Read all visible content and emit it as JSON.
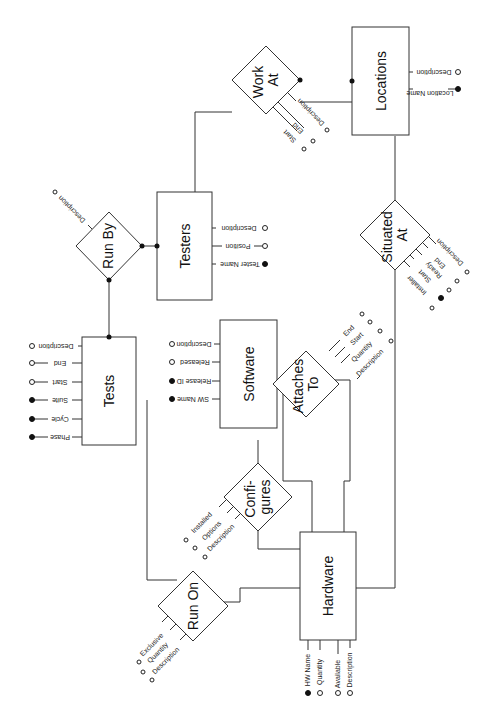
{
  "diagram": {
    "type": "entity-relationship",
    "orientation": "rotated 90 degrees clockwise",
    "entities": [
      {
        "id": "tests",
        "label": "Tests",
        "attributes": [
          {
            "name": "Phase",
            "key": true
          },
          {
            "name": "Cycle",
            "key": true
          },
          {
            "name": "Suite",
            "key": true
          },
          {
            "name": "Start",
            "key": false
          },
          {
            "name": "End",
            "key": false
          },
          {
            "name": "Description",
            "key": false
          }
        ]
      },
      {
        "id": "testers",
        "label": "Testers",
        "attributes": [
          {
            "name": "Tester Name",
            "key": true
          },
          {
            "name": "Position",
            "key": false
          },
          {
            "name": "Description",
            "key": false
          }
        ]
      },
      {
        "id": "software",
        "label": "Software",
        "attributes": [
          {
            "name": "SW Name",
            "key": true
          },
          {
            "name": "Release ID",
            "key": true
          },
          {
            "name": "Released",
            "key": false
          },
          {
            "name": "Description",
            "key": false
          }
        ]
      },
      {
        "id": "locations",
        "label": "Locations",
        "attributes": [
          {
            "name": "Location Name",
            "key": true
          },
          {
            "name": "Description",
            "key": false
          }
        ]
      },
      {
        "id": "hardware",
        "label": "Hardware",
        "attributes": [
          {
            "name": "HW Name",
            "key": true
          },
          {
            "name": "Quantity",
            "key": false
          },
          {
            "name": "Available",
            "key": false
          },
          {
            "name": "Description",
            "key": false
          }
        ]
      }
    ],
    "relationships": [
      {
        "id": "run_by",
        "label": "Run By",
        "attributes": [
          {
            "name": "Description",
            "key": false
          }
        ]
      },
      {
        "id": "work_at",
        "label_line1": "Work",
        "label_line2": "At",
        "attributes": [
          {
            "name": "Start",
            "key": false
          },
          {
            "name": "End",
            "key": false
          },
          {
            "name": "Description",
            "key": false
          }
        ]
      },
      {
        "id": "situated_at",
        "label_line1": "Situated",
        "label_line2": "At",
        "attributes": [
          {
            "name": "Installer",
            "key": false
          },
          {
            "name": "Start",
            "key": true
          },
          {
            "name": "Ready",
            "key": false
          },
          {
            "name": "End",
            "key": false
          },
          {
            "name": "Description",
            "key": false
          }
        ]
      },
      {
        "id": "attaches_to",
        "label_line1": "Attaches",
        "label_line2": "To",
        "attributes": [
          {
            "name": "End",
            "key": false
          },
          {
            "name": "Start",
            "key": false
          },
          {
            "name": "Quantity",
            "key": false
          },
          {
            "name": "Description",
            "key": false
          }
        ]
      },
      {
        "id": "configures",
        "label_line1": "Confi-",
        "label_line2": "gures",
        "attributes": [
          {
            "name": "Installed",
            "key": false
          },
          {
            "name": "Options",
            "key": false
          },
          {
            "name": "Description",
            "key": false
          }
        ]
      },
      {
        "id": "run_on",
        "label": "Run On",
        "attributes": [
          {
            "name": "Exclusive",
            "key": false
          },
          {
            "name": "Quantity",
            "key": false
          },
          {
            "name": "Description",
            "key": false
          }
        ]
      }
    ],
    "connections": [
      [
        "tests",
        "run_by"
      ],
      [
        "run_by",
        "testers"
      ],
      [
        "testers",
        "work_at"
      ],
      [
        "work_at",
        "locations"
      ],
      [
        "locations",
        "situated_at"
      ],
      [
        "situated_at",
        "hardware"
      ],
      [
        "tests",
        "run_on"
      ],
      [
        "run_on",
        "hardware"
      ],
      [
        "software",
        "configures"
      ],
      [
        "configures",
        "hardware"
      ],
      [
        "attaches_to",
        "hardware"
      ]
    ],
    "colors": {
      "line": "#333333",
      "key_marker": "#111111",
      "background": "#ffffff"
    }
  }
}
